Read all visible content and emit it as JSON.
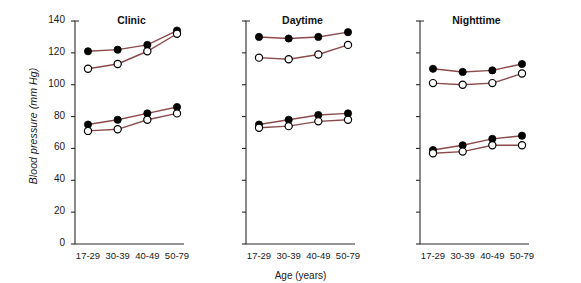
{
  "figure": {
    "ylabel_plain": "Blood pressure (",
    "ylabel_italic": "mm Hg",
    "ylabel_close": ")",
    "ylabel": "Blood pressure (mm Hg)",
    "xlabel": "Age (years)"
  },
  "chart_data": {
    "type": "line",
    "title": "",
    "xlabel": "Age (years)",
    "ylabel": "Blood pressure (mm Hg)",
    "categories": [
      "17-29",
      "30-39",
      "40-49",
      "50-79"
    ],
    "ylim": [
      0,
      140
    ],
    "yticks": [
      0,
      20,
      40,
      60,
      80,
      100,
      120,
      140
    ],
    "ytick_labels": [
      "0",
      "20",
      "40",
      "60",
      "80",
      "100",
      "120",
      "140"
    ],
    "grid": false,
    "legend": "none",
    "line_color": "#8c4b4b",
    "marker_filled_color": "#000000",
    "marker_hollow_color": "#ffffff",
    "panels": [
      {
        "title": "Clinic",
        "series": [
          {
            "name": "Systolic filled",
            "marker": "filled",
            "values": [
              121,
              122,
              125,
              134
            ]
          },
          {
            "name": "Systolic hollow",
            "marker": "hollow",
            "values": [
              110,
              113,
              121,
              132
            ]
          },
          {
            "name": "Diastolic filled",
            "marker": "filled",
            "values": [
              75,
              78,
              82,
              86
            ]
          },
          {
            "name": "Diastolic hollow",
            "marker": "hollow",
            "values": [
              71,
              72,
              78,
              82
            ]
          }
        ]
      },
      {
        "title": "Daytime",
        "series": [
          {
            "name": "Systolic filled",
            "marker": "filled",
            "values": [
              130,
              129,
              130,
              133
            ]
          },
          {
            "name": "Systolic hollow",
            "marker": "hollow",
            "values": [
              117,
              116,
              119,
              125
            ]
          },
          {
            "name": "Diastolic filled",
            "marker": "filled",
            "values": [
              75,
              78,
              81,
              82
            ]
          },
          {
            "name": "Diastolic hollow",
            "marker": "hollow",
            "values": [
              73,
              74,
              77,
              78
            ]
          }
        ]
      },
      {
        "title": "Nighttime",
        "series": [
          {
            "name": "Systolic filled",
            "marker": "filled",
            "values": [
              110,
              108,
              109,
              113
            ]
          },
          {
            "name": "Systolic hollow",
            "marker": "hollow",
            "values": [
              101,
              100,
              101,
              107
            ]
          },
          {
            "name": "Diastolic filled",
            "marker": "filled",
            "values": [
              59,
              62,
              66,
              68
            ]
          },
          {
            "name": "Diastolic hollow",
            "marker": "hollow",
            "values": [
              57,
              58,
              62,
              62
            ]
          }
        ]
      }
    ]
  }
}
